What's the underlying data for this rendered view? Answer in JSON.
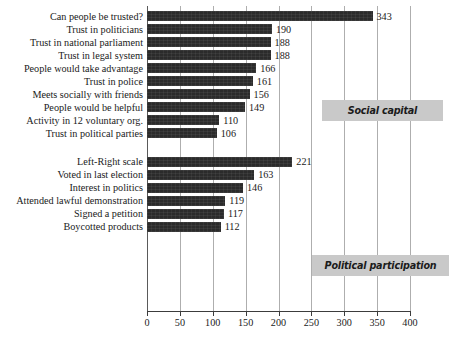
{
  "chart_data": {
    "type": "bar",
    "orientation": "horizontal",
    "title": "",
    "subtitle": "",
    "xlabel": "",
    "ylabel": "",
    "xlim": [
      0,
      400
    ],
    "xticks": [
      0,
      50,
      100,
      150,
      200,
      250,
      300,
      350,
      400
    ],
    "xtick_labels": [
      "0",
      "50",
      "100",
      "150",
      "200",
      "250",
      "300",
      "350",
      "400"
    ],
    "grid": true,
    "grid_axis": "x",
    "legend_position": "inside-right",
    "bar_color": "#2b2b2b",
    "gridline_color": "#aeaeae",
    "legend_box_color": "#c9c9c9",
    "categories": [
      "Can people be trusted?",
      "Trust in politicians",
      "Trust in national parliament",
      "Trust in legal system",
      "People would take advantage",
      "Trust in police",
      "Meets socially with friends",
      "People would be helpful",
      "Activity in 12 voluntary org.",
      "Trust in political parties",
      "Left-Right scale",
      "Voted in last election",
      "Interest in politics",
      "Attended lawful demonstration",
      "Signed a petition",
      "Boycotted products"
    ],
    "values": [
      343,
      190,
      188,
      188,
      166,
      161,
      156,
      149,
      110,
      106,
      221,
      163,
      146,
      119,
      117,
      112
    ],
    "value_labels": [
      "343",
      "190",
      "188",
      "188",
      "166",
      "161",
      "156",
      "149",
      "110",
      "106",
      "221",
      "163",
      "146",
      "119",
      "117",
      "112"
    ],
    "groups": [
      {
        "name": "Social capital",
        "start_index": 0,
        "end_index": 9,
        "items": [
          {
            "label": "Can people be trusted?",
            "value": 343
          },
          {
            "label": "Trust in politicians",
            "value": 190
          },
          {
            "label": "Trust in national parliament",
            "value": 188
          },
          {
            "label": "Trust in legal system",
            "value": 188
          },
          {
            "label": "People would take advantage",
            "value": 166
          },
          {
            "label": "Trust in police",
            "value": 161
          },
          {
            "label": "Meets socially with friends",
            "value": 156
          },
          {
            "label": "People would be helpful",
            "value": 149
          },
          {
            "label": "Activity in 12 voluntary org.",
            "value": 110
          },
          {
            "label": "Trust in political parties",
            "value": 106
          }
        ]
      },
      {
        "name": "Political participation",
        "start_index": 10,
        "end_index": 15,
        "items": [
          {
            "label": "Left-Right scale",
            "value": 221
          },
          {
            "label": "Voted in last election",
            "value": 163
          },
          {
            "label": "Interest in politics",
            "value": 146
          },
          {
            "label": "Attended lawful demonstration",
            "value": 119
          },
          {
            "label": "Signed a petition",
            "value": 117
          },
          {
            "label": "Boycotted products",
            "value": 112
          }
        ]
      }
    ],
    "annotations": [
      {
        "text": "Social capital",
        "kind": "group-callout"
      },
      {
        "text": "Political participation",
        "kind": "group-callout"
      }
    ]
  }
}
